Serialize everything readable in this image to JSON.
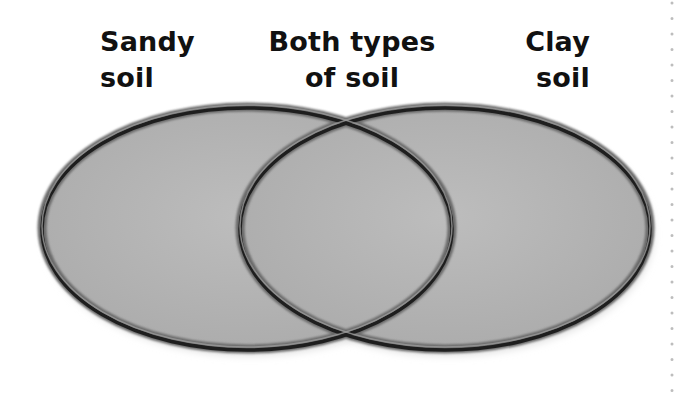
{
  "diagram": {
    "type": "venn",
    "labels": {
      "left": [
        "Sandy",
        "soil"
      ],
      "middle": [
        "Both types",
        "of soil"
      ],
      "right": [
        "Clay",
        "soil"
      ]
    },
    "sets": [
      {
        "name": "Sandy soil",
        "position": "left"
      },
      {
        "name": "Clay soil",
        "position": "right"
      }
    ],
    "intersection": "Both types of soil",
    "colors": {
      "fill": "#b4b4b4",
      "outline": "#2a2a2a",
      "text": "#111111",
      "dotted_rule": "#bdbdbd"
    }
  }
}
